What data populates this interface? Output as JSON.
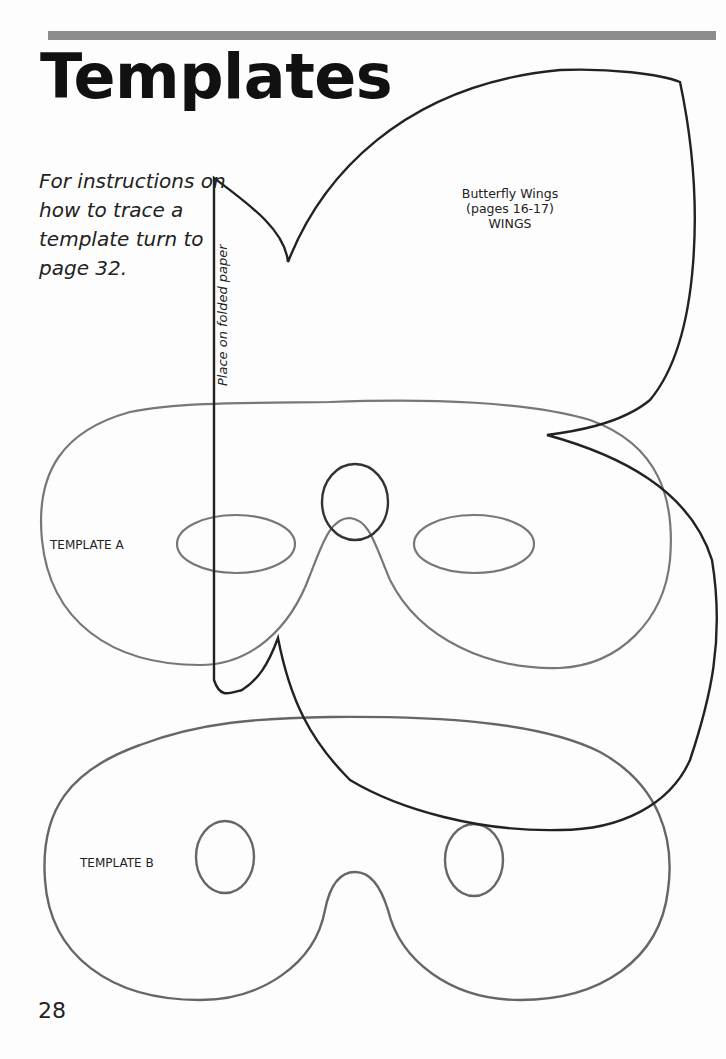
{
  "page": {
    "title": "Templates",
    "intro": "For instructions on how to trace a template turn to page 32.",
    "page_number": "28"
  },
  "templates": {
    "wings": {
      "fold_label": "Place on folded paper",
      "label_line1": "Butterfly Wings",
      "label_line2": "(pages 16-17)",
      "label_line3": "WINGS"
    },
    "mask_a": {
      "label": "TEMPLATE A"
    },
    "mask_b": {
      "label": "TEMPLATE B"
    }
  },
  "colors": {
    "rule_bar": "#8c8c8c",
    "mask_outline": "#6e6e6e",
    "wing_outline": "#222222"
  }
}
